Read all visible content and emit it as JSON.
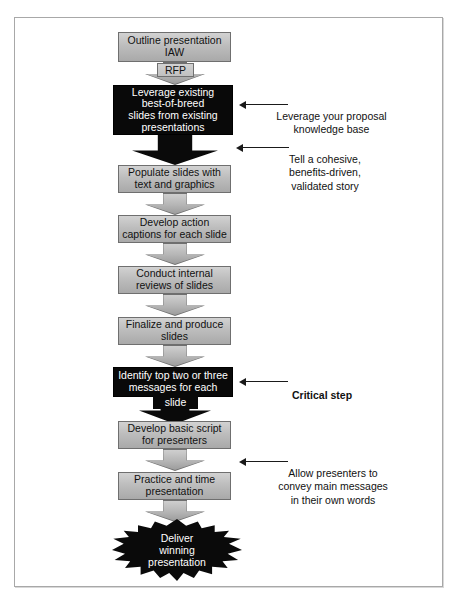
{
  "diagram": {
    "colors": {
      "frame_border": "#a8a8a8",
      "gray_box_fill_top": "#d2d2d2",
      "gray_box_fill_bottom": "#a9a9a9",
      "gray_box_border": "#6f6f6f",
      "black_box_fill": "#090909",
      "black_box_text": "#ffffff",
      "text": "#111111",
      "leader_line": "#1a1a1a"
    },
    "steps": [
      {
        "id": "outline",
        "style": "gray",
        "label": "Outline presentation\nIAW",
        "arrow_label": "RFP"
      },
      {
        "id": "leverage",
        "style": "black",
        "label": "Leverage existing\nbest-of-breed\nslides from existing\npresentations",
        "arrow_label": ""
      },
      {
        "id": "populate",
        "style": "gray",
        "label": "Populate slides with\ntext and graphics",
        "arrow_label": ""
      },
      {
        "id": "captions",
        "style": "gray",
        "label": "Develop action\ncaptions for each slide",
        "arrow_label": ""
      },
      {
        "id": "reviews",
        "style": "gray",
        "label": "Conduct internal\nreviews of slides",
        "arrow_label": ""
      },
      {
        "id": "finalize",
        "style": "gray",
        "label": "Finalize and produce\nslides",
        "arrow_label": ""
      },
      {
        "id": "messages",
        "style": "black",
        "label": "Identify top two or three\nmessages for each",
        "arrow_label": "slide"
      },
      {
        "id": "script",
        "style": "gray",
        "label": "Develop basic script\nfor presenters",
        "arrow_label": ""
      },
      {
        "id": "practice",
        "style": "gray",
        "label": "Practice and time\npresentation",
        "arrow_label": ""
      }
    ],
    "terminal": {
      "id": "deliver",
      "shape": "starburst",
      "label": "Deliver\nwinning\npresentation"
    },
    "callouts": [
      {
        "id": "knowledge-base",
        "text": "Leverage your proposal\nknowledge base",
        "bold": false,
        "target": "leverage"
      },
      {
        "id": "cohesive-story",
        "text": "Tell a cohesive,\nbenefits-driven,\nvalidated story",
        "bold": false,
        "target": "arrow-after-leverage"
      },
      {
        "id": "critical-step",
        "text": "Critical step",
        "bold": true,
        "target": "messages"
      },
      {
        "id": "own-words",
        "text": "Allow presenters to\nconvey main messages\nin their own words",
        "bold": false,
        "target": "arrow-after-script"
      }
    ]
  }
}
